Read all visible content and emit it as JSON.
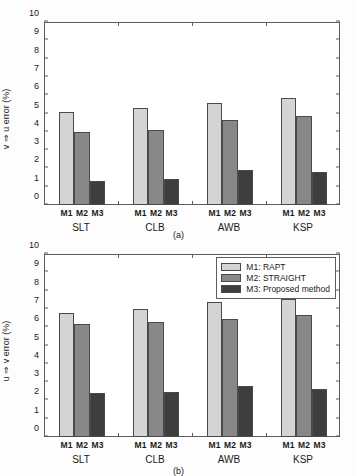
{
  "figure": {
    "background": "#fdfdfd",
    "panels": [
      {
        "id": "a",
        "caption": "(a)",
        "chart_ref": 0
      },
      {
        "id": "b",
        "caption": "(b)",
        "chart_ref": 1
      }
    ]
  },
  "colors": {
    "m1": "#d4d4d4",
    "m2": "#888888",
    "m3": "#3e3e3e",
    "axis": "#5d5d5d",
    "bar_edge": "#4a4a4a",
    "text": "#1a1a1a"
  },
  "legend": {
    "position": "top-right",
    "panel": "b",
    "entries": [
      {
        "key": "m1",
        "label": "M1: RAPT",
        "color": "#d4d4d4"
      },
      {
        "key": "m2",
        "label": "M2: STRAIGHT",
        "color": "#888888"
      },
      {
        "key": "m3",
        "label": "M3: Proposed method",
        "color": "#3e3e3e"
      }
    ]
  },
  "chart_data": [
    {
      "type": "bar",
      "title": "",
      "panel": "(a)",
      "xlabel": "",
      "ylabel": "v ⇒ u error (%)",
      "ylim": [
        0,
        10
      ],
      "yticks": [
        0,
        1,
        2,
        3,
        4,
        5,
        6,
        7,
        8,
        9,
        10
      ],
      "ytick_labels": [
        "0",
        "1",
        "2",
        "3",
        "4",
        "5",
        "6",
        "7",
        "8",
        "9",
        "10"
      ],
      "grid": false,
      "categories": [
        "SLT",
        "CLB",
        "AWB",
        "KSP"
      ],
      "subcategories": [
        "M1",
        "M2",
        "M3"
      ],
      "series": [
        {
          "name": "M1: RAPT",
          "key": "m1",
          "values": [
            5.1,
            5.3,
            5.55,
            5.85
          ]
        },
        {
          "name": "M2: STRAIGHT",
          "key": "m2",
          "values": [
            4.0,
            4.1,
            4.65,
            4.85
          ]
        },
        {
          "name": "M3: Proposed method",
          "key": "m3",
          "values": [
            1.3,
            1.4,
            1.9,
            1.8
          ]
        }
      ]
    },
    {
      "type": "bar",
      "title": "",
      "panel": "(b)",
      "xlabel": "",
      "ylabel": "u ⇒ v error (%)",
      "ylim": [
        0,
        10
      ],
      "yticks": [
        0,
        1,
        2,
        3,
        4,
        5,
        6,
        7,
        8,
        9,
        10
      ],
      "ytick_labels": [
        "0",
        "1",
        "2",
        "3",
        "4",
        "5",
        "6",
        "7",
        "8",
        "9",
        "10"
      ],
      "grid": false,
      "categories": [
        "SLT",
        "CLB",
        "AWB",
        "KSP"
      ],
      "subcategories": [
        "M1",
        "M2",
        "M3"
      ],
      "series": [
        {
          "name": "M1: RAPT",
          "key": "m1",
          "values": [
            6.78,
            7.0,
            7.38,
            7.55
          ]
        },
        {
          "name": "M2: STRAIGHT",
          "key": "m2",
          "values": [
            6.18,
            6.28,
            6.45,
            6.65
          ]
        },
        {
          "name": "M3: Proposed method",
          "key": "m3",
          "values": [
            2.38,
            2.48,
            2.78,
            2.65
          ]
        }
      ]
    }
  ]
}
